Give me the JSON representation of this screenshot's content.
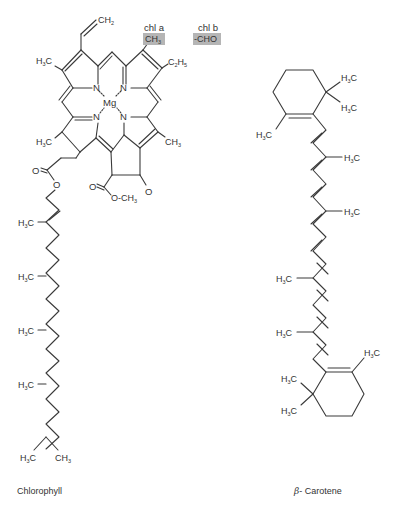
{
  "figure": {
    "molecules": [
      {
        "name": "Chlorophyll",
        "caption": "Chlorophyll",
        "central_atom": "Mg",
        "variant_header": {
          "chl_a": "chl a",
          "chl_b": "chl b"
        },
        "variant_substituent": {
          "chl_a": "CH3",
          "chl_b": "-CHO"
        },
        "highlight_color": "#b5b5b5",
        "substituent_labels": [
          "CH2",
          "H3C",
          "C2H5",
          "CH3",
          "H3C",
          "CH3",
          "O",
          "O",
          "O",
          "O-CH3"
        ],
        "phytol_chain_labels": [
          "H3C",
          "H3C",
          "H3C",
          "H3C",
          "CH3"
        ]
      },
      {
        "name": "beta-Carotene",
        "caption_symbol": "β",
        "caption_text": "- Carotene",
        "substituent_labels": [
          "H3C",
          "H3C",
          "H3C",
          "H3C",
          "H3C",
          "H3C",
          "H3C",
          "H3C",
          "H3C",
          "H3C"
        ]
      }
    ]
  },
  "labels": {
    "chla": "chl a",
    "chlb": "chl b",
    "cho": "-CHO",
    "mg": "Mg",
    "n": "N",
    "o": "O",
    "och3": "O-CH",
    "chlorophyll": "Chlorophyll",
    "beta": "β",
    "carotene": "- Carotene"
  }
}
